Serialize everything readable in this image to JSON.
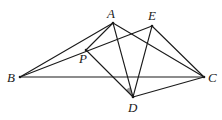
{
  "diagram": {
    "type": "geometry",
    "points": {
      "A": {
        "x": 113,
        "y": 23,
        "label": "A",
        "lx": 107,
        "ly": 18
      },
      "E": {
        "x": 152,
        "y": 26,
        "label": "E",
        "lx": 148,
        "ly": 20
      },
      "B": {
        "x": 20,
        "y": 77,
        "label": "B",
        "lx": 7,
        "ly": 82
      },
      "C": {
        "x": 204,
        "y": 77,
        "label": "C",
        "lx": 208,
        "ly": 82
      },
      "P": {
        "x": 86,
        "y": 50,
        "label": "P",
        "lx": 79,
        "ly": 63
      },
      "D": {
        "x": 133,
        "y": 97,
        "label": "D",
        "lx": 128,
        "ly": 112
      }
    },
    "segments": [
      [
        "B",
        "A"
      ],
      [
        "B",
        "E"
      ],
      [
        "B",
        "C"
      ],
      [
        "A",
        "P"
      ],
      [
        "P",
        "D"
      ],
      [
        "A",
        "D"
      ],
      [
        "A",
        "C"
      ],
      [
        "E",
        "D"
      ],
      [
        "E",
        "C"
      ],
      [
        "D",
        "C"
      ]
    ],
    "shaded_angle": {
      "vertex": "D",
      "between": [
        "P",
        "A"
      ],
      "color": "#9a9a9a"
    }
  }
}
